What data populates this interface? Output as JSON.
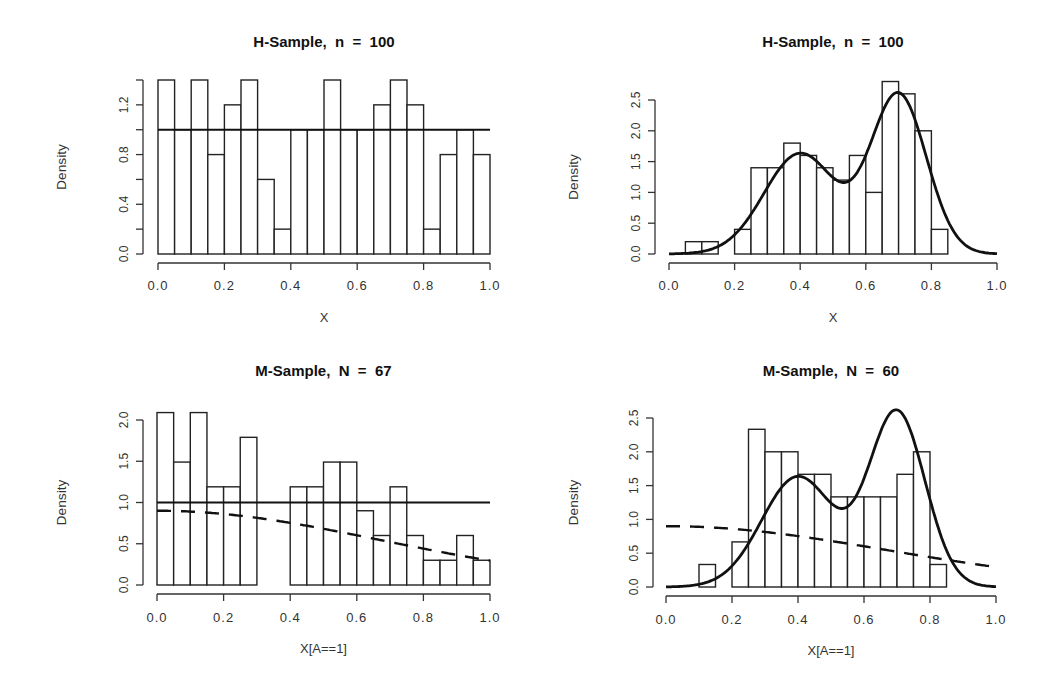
{
  "figure": {
    "panels": [
      {
        "id": "top-left",
        "title": "H-Sample,  n  =  100",
        "xlabel": "X",
        "ylabel": "Density",
        "box": {
          "x0": 158,
          "x1": 490,
          "y0": 254,
          "yTop": 80,
          "yMaxVal": 1.4,
          "yAxisX": 143,
          "xAxisY": 263,
          "titleY": 47,
          "xtickY": 290,
          "xlabelY": 322,
          "ylabX": 66
        },
        "xticks": [
          "0.0",
          "0.2",
          "0.4",
          "0.6",
          "0.8",
          "1.0"
        ],
        "yticks": [
          0,
          0.2,
          0.4,
          0.6,
          0.8,
          1.0,
          1.2,
          1.4
        ],
        "yticklabels": {
          "0": "0.0",
          "0.4": "0.4",
          "0.8": "0.8",
          "1.2": "1.2"
        }
      },
      {
        "id": "top-right",
        "title": "H-Sample,  n  =  100",
        "xlabel": "X",
        "ylabel": "Density",
        "box": {
          "x0": 669,
          "x1": 997,
          "y0": 254,
          "yTop": 100,
          "yMaxVal": 2.5,
          "yAxisX": 655,
          "xAxisY": 263,
          "titleY": 47,
          "xtickY": 290,
          "xlabelY": 322,
          "ylabX": 578
        },
        "xticks": [
          "0.0",
          "0.2",
          "0.4",
          "0.6",
          "0.8",
          "1.0"
        ],
        "yticks": [
          0,
          0.5,
          1.0,
          1.5,
          2.0,
          2.5
        ],
        "yticklabels": {
          "0": "0.0",
          "0.5": "0.5",
          "1": "1.0",
          "1.5": "1.5",
          "2": "2.0",
          "2.5": "2.5"
        }
      },
      {
        "id": "bottom-left",
        "title": "M-Sample,  N  =  67",
        "xlabel": "X[A==1]",
        "ylabel": "Density",
        "box": {
          "x0": 157,
          "x1": 490,
          "y0": 585,
          "yTop": 420,
          "yMaxVal": 2.0,
          "yAxisX": 143,
          "xAxisY": 594,
          "titleY": 376,
          "xtickY": 622,
          "xlabelY": 653,
          "ylabX": 66
        },
        "xticks": [
          "0.0",
          "0.2",
          "0.4",
          "0.6",
          "0.8",
          "1.0"
        ],
        "yticks": [
          0,
          0.5,
          1.0,
          1.5,
          2.0
        ],
        "yticklabels": {
          "0": "0.0",
          "0.5": "0.5",
          "1": "1.0",
          "1.5": "1.5",
          "2": "2.0"
        }
      },
      {
        "id": "bottom-right",
        "title": "M-Sample,  N  =  60",
        "xlabel": "X[A==1]",
        "ylabel": "Density",
        "box": {
          "x0": 666,
          "x1": 996,
          "y0": 587,
          "yTop": 418,
          "yMaxVal": 2.5,
          "yAxisX": 653,
          "xAxisY": 596,
          "titleY": 376,
          "xtickY": 624,
          "xlabelY": 655,
          "ylabX": 578
        },
        "xticks": [
          "0.0",
          "0.2",
          "0.4",
          "0.6",
          "0.8",
          "1.0"
        ],
        "yticks": [
          0,
          0.5,
          1.0,
          1.5,
          2.0,
          2.5
        ],
        "yticklabels": {
          "0": "0.0",
          "0.5": "0.5",
          "1": "1.0",
          "1.5": "1.5",
          "2": "2.0",
          "2.5": "2.5"
        }
      }
    ]
  },
  "chart_data": [
    {
      "type": "bar",
      "title": "H-Sample, n = 100",
      "xlabel": "X",
      "ylabel": "Density",
      "xlim": [
        0,
        1
      ],
      "ylim": [
        0,
        1.4
      ],
      "bin_width": 0.05,
      "bin_edges": [
        0.0,
        0.05,
        0.1,
        0.15,
        0.2,
        0.25,
        0.3,
        0.35,
        0.4,
        0.45,
        0.5,
        0.55,
        0.6,
        0.65,
        0.7,
        0.75,
        0.8,
        0.85,
        0.9,
        0.95,
        1.0
      ],
      "values": [
        1.4,
        1.0,
        1.4,
        0.8,
        1.2,
        1.4,
        0.6,
        0.2,
        1.0,
        1.0,
        1.4,
        1.0,
        1.0,
        1.2,
        1.4,
        1.2,
        0.2,
        0.8,
        1.0,
        0.8
      ],
      "overlays": [
        {
          "type": "hline",
          "name": "uniform density",
          "y": 1.0,
          "x_range": [
            0,
            1
          ],
          "style": "solid"
        }
      ],
      "grid": false
    },
    {
      "type": "bar",
      "title": "H-Sample, n = 100",
      "xlabel": "X",
      "ylabel": "Density",
      "xlim": [
        0,
        1
      ],
      "ylim": [
        0,
        2.8
      ],
      "bin_width": 0.05,
      "bin_edges": [
        0.05,
        0.1,
        0.15,
        0.2,
        0.25,
        0.3,
        0.35,
        0.4,
        0.45,
        0.5,
        0.55,
        0.6,
        0.65,
        0.7,
        0.75,
        0.8,
        0.85
      ],
      "values": [
        0.2,
        0.2,
        0.0,
        0.4,
        1.4,
        1.4,
        1.8,
        1.6,
        1.4,
        1.2,
        1.6,
        1.0,
        2.8,
        2.6,
        2.0,
        0.4
      ],
      "overlays": [
        {
          "type": "line",
          "name": "bimodal density",
          "style": "solid",
          "mixture": [
            {
              "weight": 0.45,
              "mean": 0.4,
              "sd": 0.11
            },
            {
              "weight": 0.55,
              "mean": 0.7,
              "sd": 0.085
            }
          ],
          "x_range": [
            0,
            1
          ],
          "key_points": [
            [
              0.4,
              1.64
            ],
            [
              0.54,
              1.17
            ],
            [
              0.7,
              2.58
            ]
          ]
        }
      ],
      "grid": false
    },
    {
      "type": "bar",
      "title": "M-Sample, N = 67",
      "xlabel": "X[A==1]",
      "ylabel": "Density",
      "xlim": [
        0,
        1
      ],
      "ylim": [
        0,
        2.1
      ],
      "bin_width": 0.05,
      "bin_edges": [
        0.0,
        0.05,
        0.1,
        0.15,
        0.2,
        0.25,
        0.3,
        0.35,
        0.4,
        0.45,
        0.5,
        0.55,
        0.6,
        0.65,
        0.7,
        0.75,
        0.8,
        0.85,
        0.9,
        0.95,
        1.0
      ],
      "counts": [
        7,
        5,
        7,
        4,
        4,
        6,
        0,
        0,
        4,
        4,
        5,
        5,
        3,
        2,
        4,
        2,
        1,
        1,
        2,
        1
      ],
      "values": [
        2.09,
        1.49,
        2.09,
        1.19,
        1.19,
        1.79,
        0.0,
        0.0,
        1.19,
        1.19,
        1.49,
        1.49,
        0.9,
        0.6,
        1.19,
        0.6,
        0.3,
        0.3,
        0.6,
        0.3
      ],
      "overlays": [
        {
          "type": "hline",
          "name": "uniform density",
          "y": 1.0,
          "x_range": [
            0,
            1
          ],
          "style": "solid"
        },
        {
          "type": "line",
          "name": "selection-weighted density",
          "style": "dashed",
          "halfnormal": {
            "scale": 0.9,
            "sd": 0.67
          },
          "x_range": [
            0,
            1
          ],
          "key_points": [
            [
              0.0,
              0.9
            ],
            [
              0.3,
              0.81
            ],
            [
              0.5,
              0.68
            ],
            [
              0.7,
              0.51
            ],
            [
              1.0,
              0.3
            ]
          ]
        }
      ],
      "grid": false
    },
    {
      "type": "bar",
      "title": "M-Sample, N = 60",
      "xlabel": "X[A==1]",
      "ylabel": "Density",
      "xlim": [
        0,
        1
      ],
      "ylim": [
        0,
        2.5
      ],
      "bin_width": 0.05,
      "bin_edges": [
        0.1,
        0.15,
        0.2,
        0.25,
        0.3,
        0.35,
        0.4,
        0.45,
        0.5,
        0.55,
        0.6,
        0.65,
        0.7,
        0.75,
        0.8,
        0.85
      ],
      "counts": [
        1,
        0,
        2,
        7,
        6,
        6,
        5,
        5,
        4,
        4,
        4,
        4,
        5,
        6,
        1
      ],
      "values": [
        0.333,
        0.0,
        0.667,
        2.333,
        2.0,
        2.0,
        1.667,
        1.667,
        1.333,
        1.333,
        1.333,
        1.333,
        1.667,
        2.0,
        0.333
      ],
      "overlays": [
        {
          "type": "line",
          "name": "bimodal density",
          "style": "solid",
          "mixture": [
            {
              "weight": 0.45,
              "mean": 0.4,
              "sd": 0.11
            },
            {
              "weight": 0.55,
              "mean": 0.7,
              "sd": 0.085
            }
          ],
          "x_range": [
            0,
            1
          ],
          "key_points": [
            [
              0.4,
              1.64
            ],
            [
              0.54,
              1.17
            ],
            [
              0.7,
              2.58
            ]
          ]
        },
        {
          "type": "line",
          "name": "selection-weighted density",
          "style": "dashed",
          "halfnormal": {
            "scale": 0.9,
            "sd": 0.67
          },
          "x_range": [
            0,
            1
          ],
          "key_points": [
            [
              0.0,
              0.9
            ],
            [
              0.3,
              0.81
            ],
            [
              0.5,
              0.68
            ],
            [
              0.7,
              0.51
            ],
            [
              1.0,
              0.3
            ]
          ]
        }
      ],
      "grid": false
    }
  ]
}
